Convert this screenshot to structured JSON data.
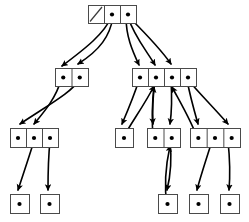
{
  "diagram": {
    "type": "tree",
    "canvas": {
      "width": 249,
      "height": 222
    },
    "style": {
      "box_stroke": "#4a4a4a",
      "box_fill": "#ffffff",
      "edge_color": "#000000",
      "dot_color": "#000000",
      "background": "#ffffff"
    },
    "levels": [
      {
        "name": "level-0-root",
        "y": 5
      },
      {
        "name": "level-1",
        "y": 68
      },
      {
        "name": "level-2",
        "y": 128
      },
      {
        "name": "level-3-leaves",
        "y": 194
      }
    ],
    "nodes": [
      {
        "id": "root",
        "label": "root-node",
        "level": 0,
        "x": 88,
        "y": 5,
        "w": 48,
        "h": 18,
        "cells": [
          {
            "index": 0,
            "kind": "null",
            "glyph": "diagonal-slash"
          },
          {
            "index": 1,
            "kind": "pointer",
            "glyph": "dot"
          },
          {
            "index": 2,
            "kind": "pointer",
            "glyph": "dot"
          }
        ]
      },
      {
        "id": "n1a",
        "label": "level1-left-node",
        "level": 1,
        "x": 55,
        "y": 68,
        "w": 33,
        "h": 18,
        "cells": [
          {
            "index": 0,
            "kind": "pointer",
            "glyph": "dot"
          },
          {
            "index": 1,
            "kind": "pointer",
            "glyph": "dot"
          }
        ]
      },
      {
        "id": "n1b",
        "label": "level1-right-node",
        "level": 1,
        "x": 132,
        "y": 68,
        "w": 64,
        "h": 18,
        "cells": [
          {
            "index": 0,
            "kind": "pointer",
            "glyph": "dot"
          },
          {
            "index": 1,
            "kind": "pointer",
            "glyph": "dot"
          },
          {
            "index": 2,
            "kind": "pointer",
            "glyph": "dot"
          },
          {
            "index": 3,
            "kind": "pointer",
            "glyph": "dot"
          }
        ]
      },
      {
        "id": "n2a",
        "label": "level2-leftmost-node",
        "level": 2,
        "x": 10,
        "y": 128,
        "w": 48,
        "h": 19,
        "cells": [
          {
            "index": 0,
            "kind": "pointer",
            "glyph": "dot"
          },
          {
            "index": 1,
            "kind": "pointer",
            "glyph": "dot"
          },
          {
            "index": 2,
            "kind": "pointer",
            "glyph": "dot"
          }
        ]
      },
      {
        "id": "n2b",
        "label": "level2-single-cell-node",
        "level": 2,
        "x": 115,
        "y": 128,
        "w": 18,
        "h": 19,
        "cells": [
          {
            "index": 0,
            "kind": "pointer",
            "glyph": "dot"
          }
        ]
      },
      {
        "id": "n2c",
        "label": "level2-middle-node",
        "level": 2,
        "x": 147,
        "y": 128,
        "w": 33,
        "h": 19,
        "cells": [
          {
            "index": 0,
            "kind": "pointer",
            "glyph": "dot"
          },
          {
            "index": 1,
            "kind": "pointer",
            "glyph": "dot"
          }
        ]
      },
      {
        "id": "n2d",
        "label": "level2-rightmost-node",
        "level": 2,
        "x": 190,
        "y": 128,
        "w": 50,
        "h": 19,
        "cells": [
          {
            "index": 0,
            "kind": "pointer",
            "glyph": "dot"
          },
          {
            "index": 1,
            "kind": "pointer",
            "glyph": "dot"
          },
          {
            "index": 2,
            "kind": "pointer",
            "glyph": "dot"
          }
        ]
      },
      {
        "id": "l1",
        "label": "leaf-node-1",
        "level": 3,
        "x": 10,
        "y": 194,
        "w": 19,
        "h": 19,
        "cells": [
          {
            "index": 0,
            "kind": "pointer",
            "glyph": "dot"
          }
        ]
      },
      {
        "id": "l2",
        "label": "leaf-node-2",
        "level": 3,
        "x": 40,
        "y": 194,
        "w": 19,
        "h": 19,
        "cells": [
          {
            "index": 0,
            "kind": "pointer",
            "glyph": "dot"
          }
        ]
      },
      {
        "id": "l3",
        "label": "leaf-node-3",
        "level": 3,
        "x": 158,
        "y": 194,
        "w": 19,
        "h": 19,
        "cells": [
          {
            "index": 0,
            "kind": "pointer",
            "glyph": "dot"
          }
        ]
      },
      {
        "id": "l4",
        "label": "leaf-node-4",
        "level": 3,
        "x": 189,
        "y": 194,
        "w": 19,
        "h": 19,
        "cells": [
          {
            "index": 0,
            "kind": "pointer",
            "glyph": "dot"
          }
        ]
      },
      {
        "id": "l5",
        "label": "leaf-node-5",
        "level": 3,
        "x": 220,
        "y": 194,
        "w": 19,
        "h": 19,
        "cells": [
          {
            "index": 0,
            "kind": "pointer",
            "glyph": "dot"
          }
        ]
      }
    ],
    "edges": [
      {
        "id": "e1",
        "from": "root.1",
        "to": "n1a.0",
        "path": "M 112 16 C 104 34, 86 48, 62 66"
      },
      {
        "id": "e2",
        "from": "root.1",
        "to": "n1a.1",
        "path": "M 113 17 C 110 36, 100 50, 78 64"
      },
      {
        "id": "e3",
        "from": "root.2",
        "to": "n1b.0",
        "path": "M 126 17 C 126 36, 132 50, 139 65"
      },
      {
        "id": "e4",
        "from": "root.2",
        "to": "n1b.1",
        "path": "M 128 17 C 134 36, 146 50, 155 65"
      },
      {
        "id": "e5",
        "from": "root.2",
        "to": "n1b.2",
        "path": "M 130 18 C 144 32, 160 48, 171 64"
      },
      {
        "id": "e6",
        "from": "n1a.0",
        "to": "n2a.1",
        "path": "M 61 80 C 56 98, 44 112, 34 124"
      },
      {
        "id": "e7",
        "from": "n1a.1",
        "to": "n2a.0",
        "path": "M 79 80 C 72 92, 50 104, 20 124"
      },
      {
        "id": "e8",
        "from": "n1b.0",
        "to": "n2b.0",
        "path": "M 139 80 C 134 96, 128 110, 122 124"
      },
      {
        "id": "e9",
        "from": "n1b.1",
        "to": "n2c.0",
        "path": "M 155 80 C 153 96, 152 110, 153 124"
      },
      {
        "id": "e10",
        "from": "n1b.2",
        "to": "n2c.1",
        "path": "M 171 80 C 172 96, 172 110, 170 124"
      },
      {
        "id": "e11",
        "from": "n1b.3",
        "to": "n2d.0",
        "path": "M 187 80 C 190 96, 194 110, 198 124"
      },
      {
        "id": "e12",
        "from": "n1b.3",
        "to": "n2d.2",
        "path": "M 189 81 C 200 94, 214 108, 228 124"
      },
      {
        "id": "e13",
        "from": "n2a.1",
        "to": "l1.0",
        "path": "M 34 141 C 28 160, 22 178, 18 190"
      },
      {
        "id": "e14",
        "from": "n2a.2",
        "to": "l2.0",
        "path": "M 50 141 C 48 160, 48 178, 48 190"
      },
      {
        "id": "e15",
        "from": "n2c.1",
        "to": "l3.0",
        "path": "M 170 141 C 172 160, 170 178, 167 190"
      },
      {
        "id": "e16",
        "from": "n2d.1",
        "to": "l4.0",
        "path": "M 212 141 C 206 160, 200 178, 197 190"
      },
      {
        "id": "e17",
        "from": "n2d.2",
        "to": "l5.0",
        "path": "M 228 141 C 230 160, 230 178, 229 190"
      },
      {
        "id": "e18",
        "from": "n2b.0",
        "to": "n1b.1",
        "path": "M 122 140 C 130 124, 144 106, 154 86"
      },
      {
        "id": "e19",
        "from": "n2c.0",
        "to": "n1b.1",
        "path": "M 153 140 C 152 122, 152 102, 154 87"
      },
      {
        "id": "e20",
        "from": "n2d.0",
        "to": "n1b.2",
        "path": "M 198 140 C 192 122, 180 102, 172 87"
      },
      {
        "id": "e21",
        "from": "l3.0",
        "to": "n2c.1",
        "path": "M 167 206 C 164 186, 166 164, 170 146"
      }
    ],
    "legend": {
      "pointer_cell": "filled dot = non-null child pointer",
      "null_cell": "diagonal slash = null pointer"
    }
  }
}
